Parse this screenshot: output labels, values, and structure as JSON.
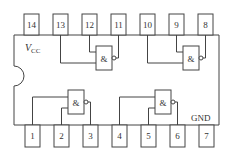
{
  "diagram": {
    "power_label": "V",
    "power_sub": "CC",
    "ground_label": "GND",
    "gate_symbol": "&",
    "top_pins": [
      "14",
      "13",
      "12",
      "11",
      "10",
      "9",
      "8"
    ],
    "bottom_pins": [
      "1",
      "2",
      "3",
      "4",
      "5",
      "6",
      "7"
    ],
    "gates": [
      {
        "id": "gate-1",
        "inputs": [
          "1",
          "2"
        ],
        "output": "3"
      },
      {
        "id": "gate-2",
        "inputs": [
          "4",
          "5"
        ],
        "output": "6"
      },
      {
        "id": "gate-3",
        "inputs": [
          "13",
          "12"
        ],
        "output": "11"
      },
      {
        "id": "gate-4",
        "inputs": [
          "10",
          "9"
        ],
        "output": "8"
      }
    ],
    "colors": {
      "line": "#444444",
      "text": "#333333",
      "background": "#ffffff"
    }
  }
}
